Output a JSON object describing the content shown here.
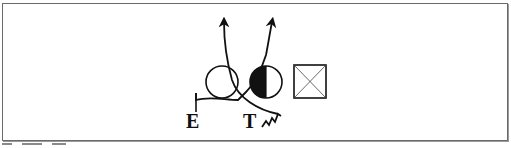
{
  "figure": {
    "labels": {
      "end": "E",
      "tackle": "T"
    },
    "symbols": [
      {
        "name": "open-circle",
        "cx": 222,
        "cy": 82,
        "r": 16
      },
      {
        "name": "half-filled-circle",
        "cx": 266,
        "cy": 82,
        "r": 16,
        "filled_side": "left"
      },
      {
        "name": "crossed-square",
        "x": 294,
        "y": 65,
        "size": 32
      }
    ],
    "colors": {
      "stroke": "#111111",
      "frame": "#6a6a6a",
      "background": "#ffffff"
    }
  },
  "caption": {
    "visible": "partial"
  }
}
